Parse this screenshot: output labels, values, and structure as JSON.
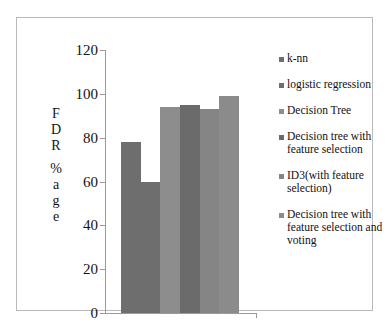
{
  "chart_data": {
    "type": "bar",
    "title": "",
    "xlabel": "",
    "ylabel": "FDR %age",
    "ylim": [
      0,
      120
    ],
    "ytick_labels": [
      "120",
      "100",
      "80",
      "60",
      "40",
      "20",
      "0"
    ],
    "ytick_values": [
      120,
      100,
      80,
      60,
      40,
      20,
      0
    ],
    "grid": false,
    "legend_position": "right",
    "categories": [
      "k-nn",
      "logistic regression",
      "Decision Tree",
      "Decision tree with feature selection",
      "ID3(with feature selection)",
      "Decision tree with feature selection and voting"
    ],
    "values": [
      78,
      60,
      94,
      95,
      93,
      99
    ],
    "bar_colors": [
      "#6e6e6e",
      "#6e6e6e",
      "#8d8d8d",
      "#6b6b6b",
      "#858585",
      "#8b8b8b"
    ]
  },
  "axis": {
    "y_title_chars": [
      "F",
      "D",
      "R",
      "%",
      "a",
      "g",
      "e"
    ]
  },
  "legend": {
    "items": [
      {
        "label": "k-nn",
        "color": "#6e6e6e"
      },
      {
        "label": "logistic regression",
        "color": "#6e6e6e"
      },
      {
        "label": "Decision Tree",
        "color": "#8d8d8d"
      },
      {
        "label": "Decision tree with feature selection",
        "color": "#6b6b6b"
      },
      {
        "label": "ID3(with feature selection)",
        "color": "#858585"
      },
      {
        "label": "Decision tree with feature selection and voting",
        "color": "#8b8b8b"
      }
    ]
  },
  "colors": {
    "background": "#ffffff",
    "frame": "#b9b9b9",
    "axis": "#9a9a9a",
    "text": "#131313"
  }
}
